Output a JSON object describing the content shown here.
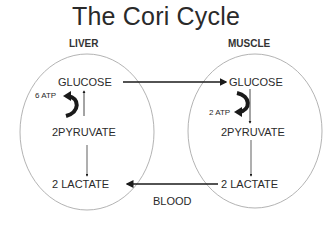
{
  "title": "The Cori Cycle",
  "liver": {
    "header": "LIVER",
    "glucose": "GLUCOSE",
    "atp": "6 ATP",
    "pyruvate": "2PYRUVATE",
    "lactate": "2 LACTATE"
  },
  "muscle": {
    "header": "MUSCLE",
    "glucose": "GLUCOSE",
    "atp": "2 ATP",
    "pyruvate": "2PYRUVATE",
    "lactate": "2 LACTATE"
  },
  "blood_label": "BLOOD",
  "colors": {
    "text": "#2a2a2a",
    "ellipse": "#999999",
    "arrow": "#1a1a1a"
  }
}
